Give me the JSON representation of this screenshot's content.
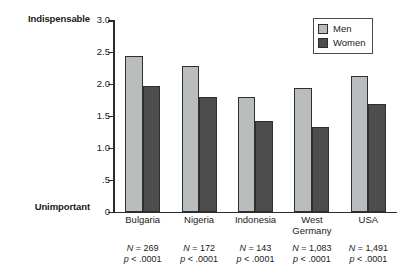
{
  "chart_data": {
    "type": "bar",
    "title": "",
    "xlabel": "",
    "ylabel": "",
    "ylim": [
      0,
      3.0
    ],
    "yticks": [
      "0",
      ".5",
      "1.0",
      "1.5",
      "2.0",
      "2.5",
      "3.0"
    ],
    "ytick_values": [
      0,
      0.5,
      1.0,
      1.5,
      2.0,
      2.5,
      3.0
    ],
    "axis_top_label": "Indispensable",
    "axis_bottom_label": "Unimportant",
    "grid": false,
    "legend_position": "top-right",
    "categories": [
      "Bulgaria",
      "Nigeria",
      "Indonesia",
      "West\nGermany",
      "USA"
    ],
    "series": [
      {
        "name": "Men",
        "color": "#b9bdbd",
        "values": [
          2.43,
          2.28,
          1.8,
          1.93,
          2.12
        ]
      },
      {
        "name": "Women",
        "color": "#4d4d4d",
        "values": [
          1.96,
          1.8,
          1.42,
          1.32,
          1.68
        ]
      }
    ],
    "annotations": [
      {
        "n": "N = 269",
        "p": "p < .0001"
      },
      {
        "n": "N = 172",
        "p": "p < .0001"
      },
      {
        "n": "N = 143",
        "p": "p < .0001"
      },
      {
        "n": "N = 1,083",
        "p": "p < .0001"
      },
      {
        "n": "N = 1,491",
        "p": "p < .0001"
      }
    ]
  },
  "legend": {
    "items": [
      {
        "label": "Men",
        "swatch": "men"
      },
      {
        "label": "Women",
        "swatch": "women"
      }
    ]
  }
}
